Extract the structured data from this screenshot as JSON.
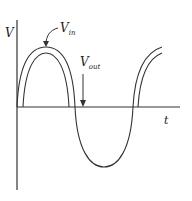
{
  "diagram": {
    "axis_y_label": "V",
    "axis_x_label": "t",
    "vin_label": {
      "main": "V",
      "sub": "in"
    },
    "vout_label": {
      "main": "V",
      "sub": "out"
    }
  }
}
